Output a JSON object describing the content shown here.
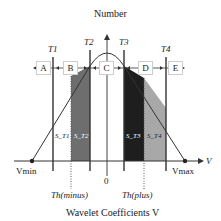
{
  "title": "Number",
  "xlabel": "Wavelet Coefficients V",
  "thresholds": [
    "T1",
    "T2",
    "T3",
    "T4"
  ],
  "regions": [
    "A",
    "B",
    "C",
    "D",
    "E"
  ],
  "areas": [
    "S_T1",
    "S_T2",
    "S_T3",
    "S_T4"
  ],
  "axis": {
    "v_label": "V",
    "origin": "0",
    "vmin": "Vmin",
    "vmax": "Vmax"
  },
  "th_labels": {
    "minus": "Th(minus)",
    "plus": "Th(plus)"
  },
  "colors": {
    "s_t2": "#6e6e6e",
    "s_t3": "#1e1e1e",
    "s_t4": "#a8a8a8"
  }
}
